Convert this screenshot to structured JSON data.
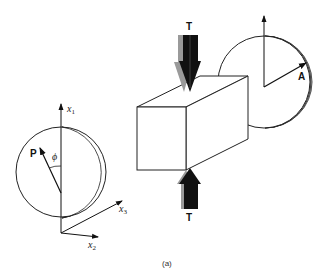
{
  "figure": {
    "caption": "(a)",
    "colors": {
      "stroke": "#222222",
      "shadow": "#aaaaaa",
      "arrow": "#111111",
      "background": "#ffffff"
    }
  },
  "torque": {
    "top_label": "T",
    "bottom_label": "T"
  },
  "right_disk": {
    "vector_label": "A"
  },
  "left_disk": {
    "vector_label": "P",
    "angle_label": "ϕ"
  },
  "axes": {
    "x1": {
      "base": "x",
      "sub": "1"
    },
    "x2": {
      "base": "x",
      "sub": "2"
    },
    "x3": {
      "base": "x",
      "sub": "3"
    }
  }
}
